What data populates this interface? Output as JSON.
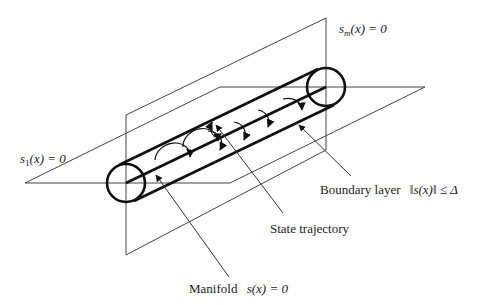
{
  "diagram": {
    "colors": {
      "stroke": "#333333",
      "tube": "#111111",
      "text": "#222222"
    },
    "labels": {
      "sm_plane": {
        "s": "s",
        "sub": "m",
        "rest": "(x) = 0"
      },
      "s1_plane": {
        "s": "s",
        "sub": "1",
        "rest": "(x) = 0"
      },
      "boundary_layer": {
        "text": "Boundary layer",
        "math": "‖s(x)‖ ≤ Δ"
      },
      "state_trajectory": {
        "text": "State trajectory"
      },
      "manifold": {
        "text": "Manifold",
        "math": "s(x) = 0"
      }
    },
    "planes": {
      "vertical_sm": {
        "points": [
          [
            126,
            115
          ],
          [
            326,
            18
          ],
          [
            326,
            150
          ],
          [
            126,
            255
          ]
        ]
      },
      "horizontal_s1": {
        "points": [
          [
            25,
            183
          ],
          [
            220,
            87
          ],
          [
            425,
            87
          ],
          [
            230,
            183
          ]
        ]
      }
    },
    "tube": {
      "left_center": [
        126,
        183
      ],
      "right_center": [
        326,
        87
      ],
      "radius": 19
    },
    "spiral_count": 6
  }
}
